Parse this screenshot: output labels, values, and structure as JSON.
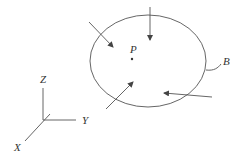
{
  "diagram": {
    "body_label": "B",
    "point_label": "P",
    "axes": {
      "x": "X",
      "y": "Y",
      "z": "Z"
    },
    "force_arrows": 4,
    "colors": {
      "stroke": "#555555",
      "text": "#333333",
      "background": "#ffffff"
    }
  }
}
